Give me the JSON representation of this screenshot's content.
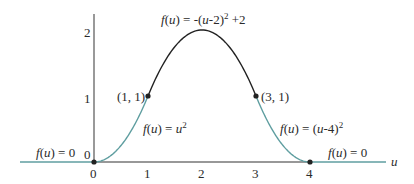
{
  "chart_data": {
    "type": "line",
    "title": "",
    "xlabel": "u",
    "ylabel": "",
    "xlim": [
      -1.4,
      5.3
    ],
    "ylim": [
      0,
      2.25
    ],
    "grid": false,
    "legend": "none",
    "x_ticks": [
      "0",
      "1",
      "2",
      "3",
      "4"
    ],
    "y_ticks": [
      "0",
      "1",
      "2"
    ],
    "series": [
      {
        "name": "f(u) = 0 (u < 0)",
        "formula": "0",
        "domain": [
          -1.4,
          0
        ],
        "color": "#5f9ea0"
      },
      {
        "name": "f(u) = u^2",
        "formula": "u^2",
        "domain": [
          0,
          1
        ],
        "color": "#5f9ea0"
      },
      {
        "name": "f(u) = -(u-2)^2 + 2",
        "formula": "-(u-2)^2+2",
        "domain": [
          1,
          3
        ],
        "color": "#222222"
      },
      {
        "name": "f(u) = (u-4)^2",
        "formula": "(u-4)^2",
        "domain": [
          3,
          4
        ],
        "color": "#5f9ea0"
      },
      {
        "name": "f(u) = 0 (u > 4)",
        "formula": "0",
        "domain": [
          4,
          5.3
        ],
        "color": "#5f9ea0"
      }
    ],
    "points": [
      {
        "x": 0,
        "y": 0,
        "label": ""
      },
      {
        "x": 1,
        "y": 1,
        "label": "(1, 1)"
      },
      {
        "x": 3,
        "y": 1,
        "label": "(3, 1)"
      },
      {
        "x": 4,
        "y": 0,
        "label": ""
      }
    ],
    "annotations": [
      {
        "text": "f(u) = -(u-2)^2 +2",
        "near": [
          2,
          2
        ]
      },
      {
        "text": "f(u) = u^2",
        "near": [
          1,
          0.5
        ]
      },
      {
        "text": "f(u) = (u-4)^2",
        "near": [
          3.4,
          0.5
        ]
      },
      {
        "text": "f(u) = 0",
        "near": [
          -1,
          0
        ]
      },
      {
        "text": "f(u) = 0",
        "near": [
          4.7,
          0
        ]
      }
    ]
  },
  "labels": {
    "axis_u": "u",
    "y_tick_0": "0",
    "y_tick_1": "1",
    "y_tick_2": "2",
    "x_tick_0": "0",
    "x_tick_1": "1",
    "x_tick_2": "2",
    "x_tick_3": "3",
    "x_tick_4": "4",
    "point_1_1": "(1, 1)",
    "point_3_1": "(3, 1)",
    "top_f": "f",
    "top_u": "u",
    "top_rest_a": ") = -(",
    "top_rest_b": "-2)",
    "top_sup": "2",
    "top_tail": " +2",
    "left_f": "f",
    "left_u": "u",
    "left_rest": ") = ",
    "left_u2": "u",
    "left_sup": "2",
    "right_f": "f",
    "right_u": "u",
    "right_rest_a": ") = (",
    "right_rest_b": "-4)",
    "right_sup": "2",
    "zero_left_f": "f",
    "zero_left_u": "u",
    "zero_left_rest": ") = 0",
    "zero_right_f": "f",
    "zero_right_u": "u",
    "zero_right_rest": ") = 0",
    "open_paren": "("
  },
  "colors": {
    "teal": "#5f9ea0",
    "curve_dark": "#222222",
    "axis": "#333333"
  }
}
